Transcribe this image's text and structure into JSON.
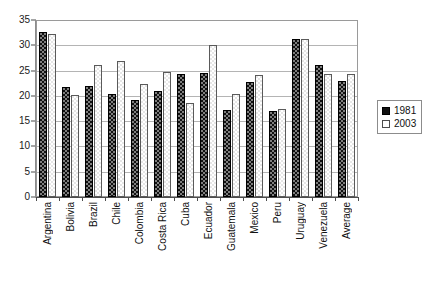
{
  "chart_data": {
    "type": "bar",
    "title": "",
    "subtitle": "",
    "xlabel": "",
    "ylabel": "",
    "ylim": [
      0,
      35
    ],
    "ytick_step": 5,
    "yticks": [
      0,
      5,
      10,
      15,
      20,
      25,
      30,
      35
    ],
    "grid": true,
    "grid_axis": "y",
    "legend_position": "right",
    "categories": [
      "Argentina",
      "Bolivia",
      "Brazil",
      "Chile",
      "Colombia",
      "Costa Rica",
      "Cuba",
      "Ecuador",
      "Guatemala",
      "Mexico",
      "Peru",
      "Uruguay",
      "Venezuela",
      "Average"
    ],
    "series": [
      {
        "name": "1981",
        "color": "#111111",
        "values": [
          32.7,
          21.7,
          22.0,
          20.3,
          19.1,
          20.9,
          24.4,
          24.5,
          17.2,
          22.8,
          17.1,
          31.3,
          26.2,
          23.0
        ]
      },
      {
        "name": "2003",
        "color": "#ffffff",
        "values": [
          32.2,
          20.1,
          26.2,
          26.8,
          22.4,
          24.7,
          18.6,
          30.1,
          20.3,
          24.1,
          17.5,
          31.2,
          24.3,
          24.4
        ]
      }
    ]
  },
  "legend": {
    "items": [
      {
        "label": "1981"
      },
      {
        "label": "2003"
      }
    ]
  },
  "colors": {
    "series_1981": "#111111",
    "series_2003": "#ffffff",
    "gridline": "#b4b4b4",
    "axis": "#4d4d4d",
    "text": "#111111",
    "background": "#ffffff"
  }
}
